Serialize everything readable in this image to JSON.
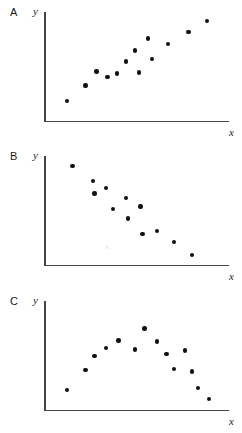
{
  "figure": {
    "title": "",
    "width": 242,
    "height": 433,
    "marker_color": "#111111",
    "axis_color": "#444444",
    "background": "#ffffff"
  },
  "panels": [
    {
      "label": "A",
      "ylabel": "y",
      "xlabel": "x"
    },
    {
      "label": "B",
      "ylabel": "y",
      "xlabel": "x"
    },
    {
      "label": "C",
      "ylabel": "y",
      "xlabel": "x"
    }
  ],
  "chart_data": [
    {
      "type": "scatter",
      "panel": "A",
      "title": "",
      "xlabel": "x",
      "ylabel": "y",
      "xlim": [
        0,
        100
      ],
      "ylim": [
        0,
        100
      ],
      "grid": false,
      "legend": null,
      "annotation": "positive linear relationship",
      "points": [
        {
          "x": 12,
          "y": 20
        },
        {
          "x": 22,
          "y": 34
        },
        {
          "x": 28,
          "y": 47
        },
        {
          "x": 34,
          "y": 42
        },
        {
          "x": 39,
          "y": 45
        },
        {
          "x": 44,
          "y": 56
        },
        {
          "x": 49,
          "y": 66
        },
        {
          "x": 51,
          "y": 46
        },
        {
          "x": 56,
          "y": 77
        },
        {
          "x": 58,
          "y": 58
        },
        {
          "x": 67,
          "y": 72
        },
        {
          "x": 78,
          "y": 83
        },
        {
          "x": 88,
          "y": 93
        }
      ]
    },
    {
      "type": "scatter",
      "panel": "B",
      "title": "",
      "xlabel": "x",
      "ylabel": "y",
      "xlim": [
        0,
        100
      ],
      "ylim": [
        0,
        100
      ],
      "grid": false,
      "legend": null,
      "annotation": "negative linear relationship",
      "points": [
        {
          "x": 15,
          "y": 92
        },
        {
          "x": 26,
          "y": 78
        },
        {
          "x": 27,
          "y": 67
        },
        {
          "x": 33,
          "y": 72
        },
        {
          "x": 37,
          "y": 53
        },
        {
          "x": 44,
          "y": 63
        },
        {
          "x": 45,
          "y": 44
        },
        {
          "x": 52,
          "y": 55
        },
        {
          "x": 53,
          "y": 30
        },
        {
          "x": 61,
          "y": 33
        },
        {
          "x": 70,
          "y": 23
        },
        {
          "x": 80,
          "y": 11
        }
      ]
    },
    {
      "type": "scatter",
      "panel": "C",
      "title": "",
      "xlabel": "x",
      "ylabel": "y",
      "xlim": [
        0,
        100
      ],
      "ylim": [
        0,
        100
      ],
      "grid": false,
      "legend": null,
      "annotation": "curvilinear (inverted-U) relationship",
      "points": [
        {
          "x": 12,
          "y": 20
        },
        {
          "x": 22,
          "y": 38
        },
        {
          "x": 27,
          "y": 51
        },
        {
          "x": 33,
          "y": 58
        },
        {
          "x": 40,
          "y": 65
        },
        {
          "x": 49,
          "y": 57
        },
        {
          "x": 54,
          "y": 76
        },
        {
          "x": 61,
          "y": 64
        },
        {
          "x": 66,
          "y": 53
        },
        {
          "x": 70,
          "y": 39
        },
        {
          "x": 76,
          "y": 56
        },
        {
          "x": 80,
          "y": 37
        },
        {
          "x": 83,
          "y": 22
        },
        {
          "x": 89,
          "y": 12
        }
      ]
    }
  ]
}
